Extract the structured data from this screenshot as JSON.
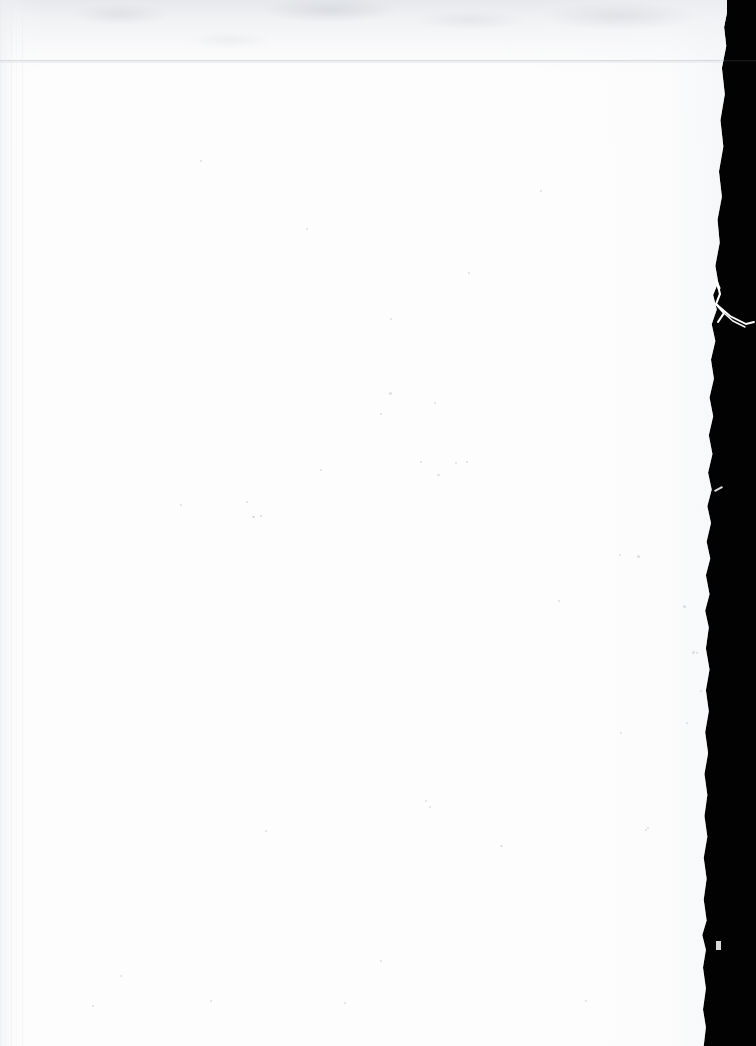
{
  "document": {
    "kind": "scanned-page",
    "page_content": "",
    "page_text": "",
    "note": "Blank scanned sheet — no printed text, headings, figures or page numbers are visible.",
    "orientation": "portrait",
    "width_px": 756,
    "height_px": 1046
  },
  "scan": {
    "paper_color": "#fdfdfd",
    "backdrop_color": "#020202",
    "paper_right_edge_x": 719,
    "backdrop_label": "scanner-backdrop",
    "paper_label": "paper-sheet",
    "artifacts": {
      "top_band_label": "top-tonal-band",
      "top_band_color": "#e4e6ea",
      "seam_label": "scan-head-seam",
      "seam_y": 60,
      "seam_color": "#c4c7cd",
      "bottom_line_label": "bottom-edge-line",
      "bottom_line_y": 1040,
      "left_stripe_label": "left-margin-striping",
      "fiber_label": "torn-edge-fiber",
      "fiber_color": "#ffffff"
    },
    "specks": [
      {
        "x": 389,
        "y": 392,
        "w": 3,
        "h": 3
      },
      {
        "x": 380,
        "y": 413,
        "w": 2,
        "h": 2
      },
      {
        "x": 434,
        "y": 402,
        "w": 2,
        "h": 2
      },
      {
        "x": 437,
        "y": 474,
        "w": 3,
        "h": 2
      },
      {
        "x": 320,
        "y": 469,
        "w": 2,
        "h": 2
      },
      {
        "x": 246,
        "y": 501,
        "w": 2,
        "h": 2
      },
      {
        "x": 260,
        "y": 515,
        "w": 2,
        "h": 2
      },
      {
        "x": 253,
        "y": 516,
        "w": 2,
        "h": 2
      },
      {
        "x": 420,
        "y": 461,
        "w": 2,
        "h": 2
      },
      {
        "x": 455,
        "y": 462,
        "w": 2,
        "h": 2
      },
      {
        "x": 466,
        "y": 461,
        "w": 2,
        "h": 2
      },
      {
        "x": 180,
        "y": 504,
        "w": 2,
        "h": 2
      },
      {
        "x": 252,
        "y": 516,
        "w": 2,
        "h": 2
      },
      {
        "x": 637,
        "y": 555,
        "w": 3,
        "h": 3
      },
      {
        "x": 619,
        "y": 554,
        "w": 2,
        "h": 2
      },
      {
        "x": 683,
        "y": 605,
        "w": 3,
        "h": 3
      },
      {
        "x": 692,
        "y": 651,
        "w": 3,
        "h": 3
      },
      {
        "x": 696,
        "y": 652,
        "w": 2,
        "h": 2
      },
      {
        "x": 558,
        "y": 600,
        "w": 2,
        "h": 2
      },
      {
        "x": 686,
        "y": 722,
        "w": 2,
        "h": 2
      },
      {
        "x": 620,
        "y": 732,
        "w": 2,
        "h": 2
      },
      {
        "x": 700,
        "y": 690,
        "w": 2,
        "h": 2
      },
      {
        "x": 711,
        "y": 789,
        "w": 2,
        "h": 2
      },
      {
        "x": 425,
        "y": 800,
        "w": 2,
        "h": 2
      },
      {
        "x": 429,
        "y": 806,
        "w": 2,
        "h": 2
      },
      {
        "x": 647,
        "y": 827,
        "w": 2,
        "h": 2
      },
      {
        "x": 645,
        "y": 829,
        "w": 2,
        "h": 2
      },
      {
        "x": 265,
        "y": 830,
        "w": 2,
        "h": 2
      },
      {
        "x": 500,
        "y": 845,
        "w": 3,
        "h": 2
      },
      {
        "x": 380,
        "y": 960,
        "w": 2,
        "h": 2
      },
      {
        "x": 120,
        "y": 975,
        "w": 2,
        "h": 2
      },
      {
        "x": 210,
        "y": 1000,
        "w": 2,
        "h": 2
      },
      {
        "x": 344,
        "y": 1002,
        "w": 2,
        "h": 2
      },
      {
        "x": 92,
        "y": 1005,
        "w": 2,
        "h": 2
      },
      {
        "x": 585,
        "y": 1000,
        "w": 2,
        "h": 2
      },
      {
        "x": 200,
        "y": 160,
        "w": 2,
        "h": 2
      },
      {
        "x": 540,
        "y": 190,
        "w": 2,
        "h": 2
      },
      {
        "x": 306,
        "y": 228,
        "w": 2,
        "h": 2
      },
      {
        "x": 390,
        "y": 318,
        "w": 2,
        "h": 2
      },
      {
        "x": 468,
        "y": 272,
        "w": 2,
        "h": 2
      }
    ]
  }
}
